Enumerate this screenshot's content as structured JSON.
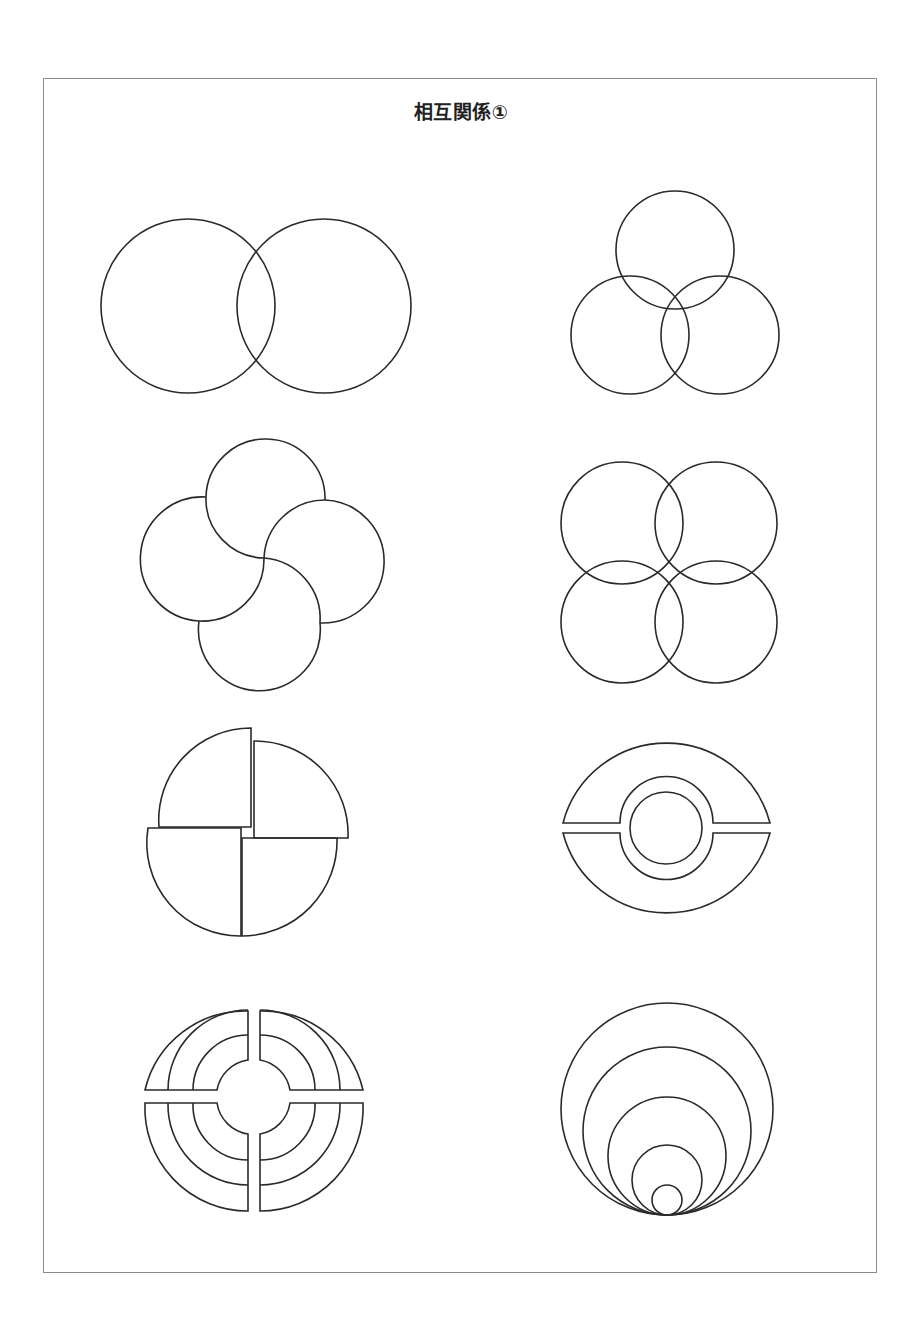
{
  "page": {
    "title": "相互関係①",
    "frame_color": "#8c8c8c",
    "stroke_color": "#2a2a2a"
  },
  "diagrams": [
    {
      "id": 1,
      "description": "Two overlapping circles (Venn)"
    },
    {
      "id": 2,
      "description": "Three overlapping circles in triangle arrangement"
    },
    {
      "id": 3,
      "description": "Four interlocking circles in pinwheel arrangement"
    },
    {
      "id": 4,
      "description": "Four overlapping circles in 2x2 grid"
    },
    {
      "id": 5,
      "description": "Circle split into four offset quarter segments"
    },
    {
      "id": 6,
      "description": "Circle split horizontally with central ring and inner circle"
    },
    {
      "id": 7,
      "description": "Concentric rings divided into four quadrants"
    },
    {
      "id": 8,
      "description": "Nested circles tangent at bottom point"
    }
  ]
}
